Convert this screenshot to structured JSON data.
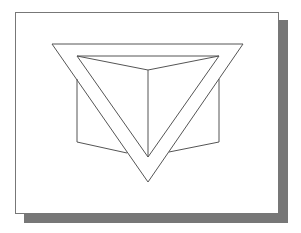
{
  "figure": {
    "shapes": [
      {
        "name": "outer-triangle",
        "kind": "triangle"
      },
      {
        "name": "inner-triangle",
        "kind": "triangle"
      },
      {
        "name": "cube-outline",
        "kind": "cube"
      }
    ],
    "colors": {
      "line": "#555555",
      "frame_border": "#777777",
      "shadow": "#777777",
      "background": "#ffffff"
    }
  }
}
